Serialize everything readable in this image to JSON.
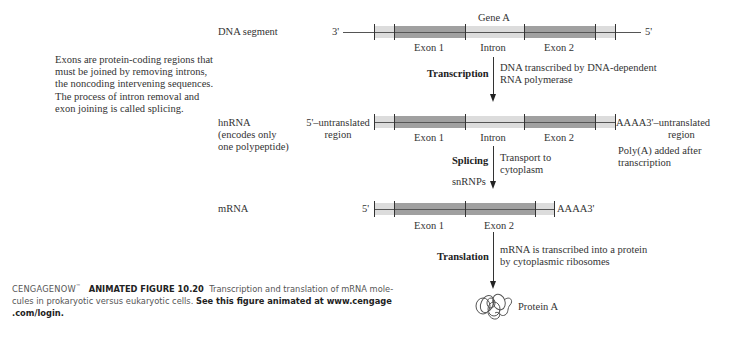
{
  "left_note": {
    "lines": [
      "Exons are protein-coding regions that",
      "must be joined by removing introns,",
      "the noncoding intervening sequences.",
      "The process of intron removal and",
      "exon joining is called splicing."
    ]
  },
  "dna": {
    "row_label": "DNA segment",
    "gene_label": "Gene A",
    "left_end": "3'",
    "right_end": "5'",
    "segments": [
      "Exon 1",
      "Intron",
      "Exon 2"
    ]
  },
  "step_transcription": {
    "label": "Transcription",
    "desc_lines": [
      "DNA transcribed by DNA-dependent",
      "RNA polymerase"
    ]
  },
  "hnrna": {
    "row_label_lines": [
      "hnRNA",
      "(encodes only",
      "one polypeptide)"
    ],
    "left_label_lines": [
      "5'–untranslated",
      "region"
    ],
    "right_label_lines": [
      "AAAA3'–untranslated",
      "region"
    ],
    "segments": [
      "Exon 1",
      "Intron",
      "Exon 2"
    ],
    "polya_note_lines": [
      "Poly(A) added after",
      "transcription"
    ]
  },
  "step_splicing": {
    "label": "Splicing",
    "sublabel": "snRNPs",
    "desc_lines": [
      "Transport to",
      "cytoplasm"
    ]
  },
  "mrna": {
    "row_label": "mRNA",
    "left_end": "5'",
    "right_end": "AAAA3'",
    "segments": [
      "Exon 1",
      "Exon 2"
    ]
  },
  "step_translation": {
    "label": "Translation",
    "desc_lines": [
      "mRNA is transcribed into a protein",
      "by cytoplasmic ribosomes"
    ]
  },
  "protein": {
    "label": "Protein A",
    "icon": "protein-coil-icon"
  },
  "caption": {
    "brand": "CENGAGENOW",
    "brand_mark": "™",
    "figure": "ANIMATED FIGURE 10.20",
    "text_line1": "Transcription and translation of mRNA mole-",
    "text_line2": "cules in prokaryotic versus eukaryotic cells.",
    "link_line2": "See this figure animated at www.cengage",
    "link_line3": ".com/login."
  },
  "colors": {
    "exon": "#a0a0a0",
    "untranslated": "#dcdcdc",
    "line": "#333333",
    "text": "#333333"
  }
}
